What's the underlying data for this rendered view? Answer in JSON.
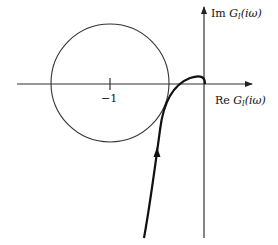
{
  "diagram": {
    "type": "nyquist-plot",
    "axes": {
      "imag_label": {
        "prefix": "Im",
        "func": "G",
        "sub": "l",
        "arg": "(iω)"
      },
      "real_label": {
        "prefix": "Re",
        "func": "G",
        "sub": "l",
        "arg": "(iω)"
      }
    },
    "tick_label": "−1",
    "circle": {
      "center_label": "−1",
      "description": "circle centered at −1"
    },
    "curve": {
      "description": "Nyquist locus rising from below, passing near circle, ending at origin",
      "direction": "upward"
    },
    "colors": {
      "stroke": "#222222",
      "background": "#ffffff"
    }
  }
}
